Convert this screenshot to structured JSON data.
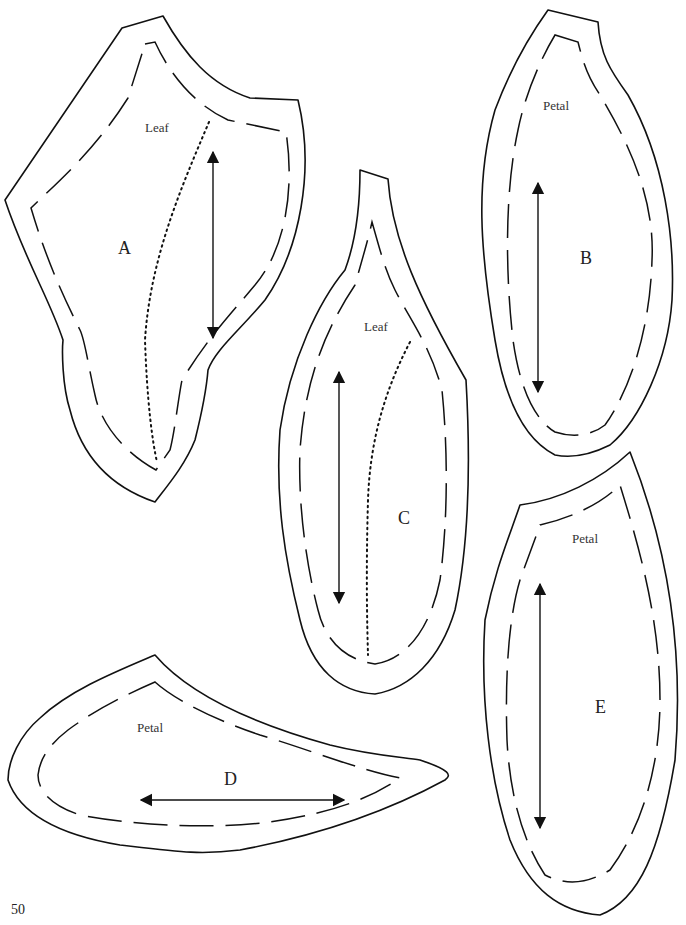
{
  "page": {
    "number": "50",
    "background": "#ffffff",
    "line_color": "#111111"
  },
  "pieces": {
    "A": {
      "letter": "A",
      "type_label": "Leaf",
      "has_vein": true,
      "grain_arrow": "vertical"
    },
    "B": {
      "letter": "B",
      "type_label": "Petal",
      "has_vein": false,
      "grain_arrow": "vertical"
    },
    "C": {
      "letter": "C",
      "type_label": "Leaf",
      "has_vein": true,
      "grain_arrow": "vertical"
    },
    "D": {
      "letter": "D",
      "type_label": "Petal",
      "has_vein": false,
      "grain_arrow": "horizontal"
    },
    "E": {
      "letter": "E",
      "type_label": "Petal",
      "has_vein": false,
      "grain_arrow": "vertical"
    }
  },
  "legend_hints": {
    "solid_line": "cutting line",
    "dashed_line": "seam allowance",
    "dotted_line": "vein line",
    "double_arrow": "grain direction"
  }
}
